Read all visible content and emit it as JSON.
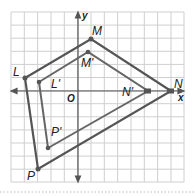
{
  "figure": {
    "axes": {
      "x_label": "x",
      "y_label": "y",
      "origin_label": "O"
    },
    "grid": {
      "cells_x": 13,
      "cells_y": 13
    },
    "polygon_original": {
      "vertices": [
        {
          "name": "L",
          "coord": [
            -4,
            1
          ]
        },
        {
          "name": "M",
          "coord": [
            1,
            4
          ]
        },
        {
          "name": "N",
          "coord": [
            7,
            0
          ]
        },
        {
          "name": "P",
          "coord": [
            -3,
            -6
          ]
        }
      ]
    },
    "polygon_image": {
      "vertices": [
        {
          "name": "L'",
          "coord": [
            -3,
            1
          ]
        },
        {
          "name": "M'",
          "coord": [
            1,
            3
          ]
        },
        {
          "name": "N'",
          "coord": [
            5,
            0
          ]
        },
        {
          "name": "P'",
          "coord": [
            -2,
            -4
          ]
        }
      ]
    },
    "colors": {
      "line": "#555555",
      "grid": "#c8c8c8",
      "axis": "#555555"
    }
  }
}
